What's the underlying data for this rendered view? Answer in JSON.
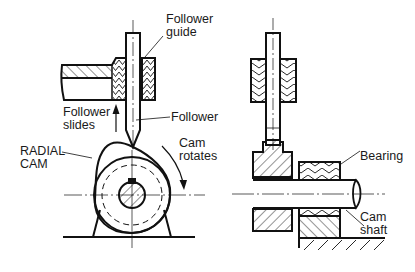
{
  "diagram": {
    "views": [
      "front-view",
      "side-view"
    ],
    "labels": {
      "follower_guide": [
        "Follower",
        "guide"
      ],
      "follower_slides": [
        "Follower",
        "slides"
      ],
      "follower": "Follower",
      "radial_cam": [
        "RADIAL",
        "CAM"
      ],
      "cam_rotates": [
        "Cam",
        "rotates"
      ],
      "bearing": "Bearing",
      "cam_shaft": [
        "Cam",
        "shaft"
      ]
    },
    "colors": {
      "line": "#111111",
      "background": "#ffffff",
      "text": "#1a1a1a"
    }
  }
}
